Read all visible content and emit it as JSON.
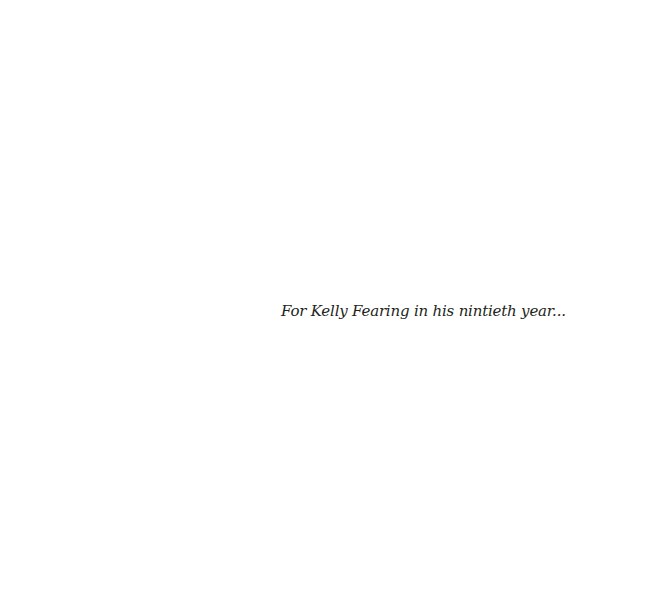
{
  "page": {
    "dedication": "For Kelly Fearing in his nintieth year..."
  }
}
